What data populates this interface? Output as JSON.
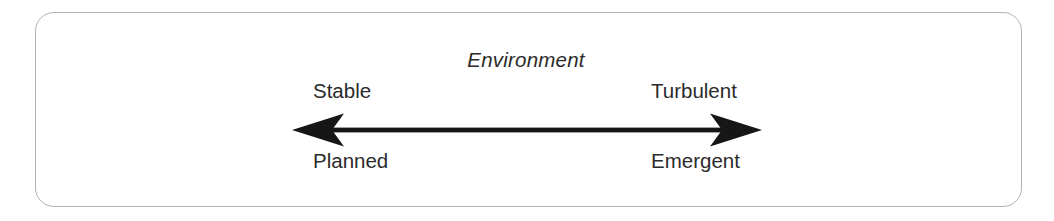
{
  "diagram": {
    "type": "continuum-axis",
    "frame": {
      "shape": "rounded-rectangle",
      "border_color": "#b3b3b3",
      "background_color": "#ffffff"
    },
    "axis_title": "Environment",
    "axis": {
      "name": "environment-continuum",
      "style": "double-headed-arrow",
      "color": "#1a1a1a",
      "left_end_label": "Stable",
      "right_end_label": "Turbulent",
      "left_outcome_label": "Planned",
      "right_outcome_label": "Emergent"
    },
    "labels": {
      "top_left": "Stable",
      "top_right": "Turbulent",
      "bottom_left": "Planned",
      "bottom_right": "Emergent"
    },
    "text_color": "#2b2b2b"
  }
}
